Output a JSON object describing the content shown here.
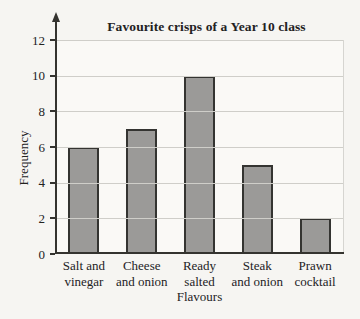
{
  "chart_data": {
    "type": "bar",
    "title": "Favourite crisps of a Year 10 class",
    "xlabel": "Flavours",
    "ylabel": "Frequency",
    "categories": [
      "Salt and vinegar",
      "Cheese and onion",
      "Ready salted",
      "Steak and onion",
      "Prawn cocktail"
    ],
    "category_lines": [
      [
        "Salt and",
        "vinegar"
      ],
      [
        "Cheese",
        "and onion"
      ],
      [
        "Ready",
        "salted"
      ],
      [
        "Steak",
        "and onion"
      ],
      [
        "Prawn",
        "cocktail"
      ]
    ],
    "values": [
      6,
      7,
      10,
      5,
      2
    ],
    "ylim": [
      0,
      12
    ],
    "yticks": [
      0,
      2,
      4,
      6,
      8,
      10,
      12
    ],
    "grid": true,
    "legend": false,
    "colors": {
      "bar_fill": "#9b9a98",
      "bar_border": "#343431",
      "gridline": "#cfcec9",
      "axis": "#34332f",
      "background": "#f6f5f2",
      "text": "#23221f"
    }
  }
}
